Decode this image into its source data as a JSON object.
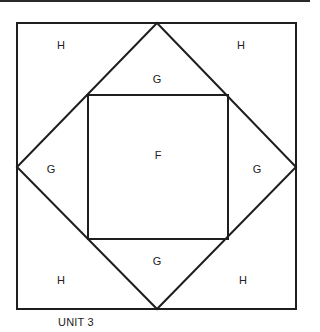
{
  "diagram": {
    "caption": "UNIT 3",
    "stroke_color": "#1e1e1e",
    "outer_square": {
      "x": 17,
      "y": 23,
      "w": 279,
      "h": 286
    },
    "diamond": {
      "top": [
        157,
        23
      ],
      "right": [
        296,
        167
      ],
      "bottom": [
        157,
        309
      ],
      "left": [
        17,
        167
      ]
    },
    "inner_square": {
      "x": 88,
      "y": 95,
      "w": 140,
      "h": 144
    },
    "labels": {
      "corner_top_left": "H",
      "corner_top_right": "H",
      "corner_bottom_left": "H",
      "corner_bottom_right": "H",
      "triangle_top": "G",
      "triangle_left": "G",
      "triangle_right": "G",
      "triangle_bottom": "G",
      "center": "F"
    }
  }
}
